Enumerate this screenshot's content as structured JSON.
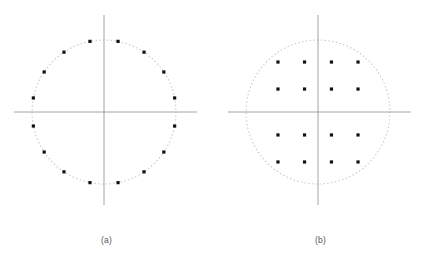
{
  "figure": {
    "background_color": "#ffffff",
    "axis_color": "#9a9a9a",
    "circle_color": "#c8c8c8",
    "point_color": "#111111",
    "caption_color": "#555555"
  },
  "panels": [
    {
      "id": "panel-a",
      "caption": "(a)",
      "chart_data": {
        "type": "scatter",
        "title": "(a)",
        "subtitle": "",
        "xlabel": "",
        "ylabel": "",
        "constellation": "16-PSK",
        "num_points": 16,
        "grid": false,
        "legend": false,
        "axis_lines": [
          "horizontal",
          "vertical"
        ],
        "reference_circle": {
          "radius": 1.0,
          "style": "dotted",
          "center": [
            0,
            0
          ]
        },
        "xlim": [
          -1.27,
          1.27
        ],
        "ylim": [
          -1.36,
          1.36
        ],
        "xticklabels": [],
        "yticklabels": [],
        "annotations": [],
        "points": [
          {
            "x": 0.195,
            "y": 0.981
          },
          {
            "x": 0.556,
            "y": 0.831
          },
          {
            "x": 0.831,
            "y": 0.556
          },
          {
            "x": 0.981,
            "y": 0.195
          },
          {
            "x": 0.981,
            "y": -0.195
          },
          {
            "x": 0.831,
            "y": -0.556
          },
          {
            "x": 0.556,
            "y": -0.831
          },
          {
            "x": 0.195,
            "y": -0.981
          },
          {
            "x": -0.195,
            "y": -0.981
          },
          {
            "x": -0.556,
            "y": -0.831
          },
          {
            "x": -0.831,
            "y": -0.556
          },
          {
            "x": -0.981,
            "y": -0.195
          },
          {
            "x": -0.981,
            "y": 0.195
          },
          {
            "x": -0.831,
            "y": 0.556
          },
          {
            "x": -0.556,
            "y": 0.831
          },
          {
            "x": -0.195,
            "y": 0.981
          }
        ]
      }
    },
    {
      "id": "panel-b",
      "caption": "(b)",
      "chart_data": {
        "type": "scatter",
        "title": "(b)",
        "subtitle": "",
        "xlabel": "",
        "ylabel": "",
        "constellation": "16-QAM",
        "num_points": 16,
        "grid": false,
        "legend": false,
        "axis_lines": [
          "horizontal",
          "vertical"
        ],
        "reference_circle": {
          "radius": 1.0,
          "style": "dotted",
          "center": [
            0,
            0
          ]
        },
        "xlim": [
          -1.27,
          1.27
        ],
        "ylim": [
          -1.36,
          1.36
        ],
        "xticklabels": [],
        "yticklabels": [],
        "annotations": [],
        "points": [
          {
            "x": -0.556,
            "y": 0.694
          },
          {
            "x": -0.187,
            "y": 0.694
          },
          {
            "x": 0.187,
            "y": 0.694
          },
          {
            "x": 0.556,
            "y": 0.694
          },
          {
            "x": -0.556,
            "y": 0.319
          },
          {
            "x": -0.187,
            "y": 0.319
          },
          {
            "x": 0.187,
            "y": 0.319
          },
          {
            "x": 0.556,
            "y": 0.319
          },
          {
            "x": -0.556,
            "y": -0.319
          },
          {
            "x": -0.187,
            "y": -0.319
          },
          {
            "x": 0.187,
            "y": -0.319
          },
          {
            "x": 0.556,
            "y": -0.319
          },
          {
            "x": -0.556,
            "y": -0.694
          },
          {
            "x": -0.187,
            "y": -0.694
          },
          {
            "x": 0.187,
            "y": -0.694
          },
          {
            "x": 0.556,
            "y": -0.694
          }
        ]
      }
    }
  ]
}
